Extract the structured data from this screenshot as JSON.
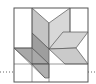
{
  "figure": {
    "colors": {
      "background": "#ffffff",
      "outline": "#555555",
      "light": "#d6d6d6",
      "lighter": "#e2e2e2",
      "medium": "#bdbdbd",
      "dark": "#a3a3a3",
      "darker": "#8f8f8f",
      "dotted_line": "#666666"
    },
    "outer_square": {
      "x": 14,
      "y": 8,
      "size": 74
    },
    "dotted_guide_y": 72
  }
}
